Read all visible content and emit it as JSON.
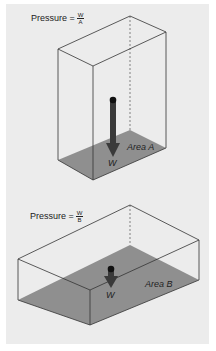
{
  "figure": {
    "background": "#ececec",
    "floor_color": "#8f8f8f",
    "arrow_color": "#3a3a3a",
    "line_color": "#333333"
  },
  "top_diagram": {
    "formula_label": "Pressure =",
    "numerator": "W",
    "denominator": "A",
    "area_label": "Area A",
    "force_label": "W"
  },
  "bottom_diagram": {
    "formula_label": "Pressure =",
    "numerator": "W",
    "denominator": "B",
    "area_label": "Area B",
    "force_label": "W"
  }
}
